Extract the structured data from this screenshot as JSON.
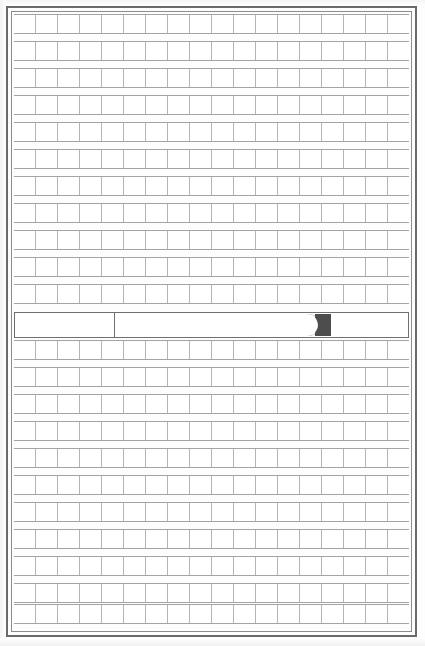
{
  "document": {
    "kind": "grid-ruled-form-sheet",
    "title": "Grid Ruled Sheet",
    "page_width": 425,
    "page_height": 646,
    "background_color": "#ffffff",
    "is_blank": true,
    "visible_text": ""
  },
  "border": {
    "style": "double-rule",
    "outer": {
      "color": "#6a6a6a",
      "thickness": 2,
      "left": 6,
      "top": 6,
      "width": 411,
      "height": 631
    },
    "inner": {
      "color": "#8c8c8c",
      "thickness": 1,
      "left": 11,
      "top": 11,
      "width": 401,
      "height": 621
    }
  },
  "grid": {
    "left": 14,
    "top": 14,
    "width": 395,
    "height": 615,
    "columns": 18,
    "row_line_color": "#a3a3a3",
    "cell_line_color": "#b4b4b4",
    "cell_fill": "#ffffff",
    "row_height": 19,
    "row_gap": 8,
    "rows_above_band": 11,
    "rows_below_band": 10,
    "rows_total": 21,
    "rows": [
      {
        "index": 1,
        "top": 0,
        "height": 20,
        "section": "upper"
      },
      {
        "index": 2,
        "top": 27,
        "height": 20,
        "section": "upper"
      },
      {
        "index": 3,
        "top": 54,
        "height": 20,
        "section": "upper"
      },
      {
        "index": 4,
        "top": 81,
        "height": 20,
        "section": "upper"
      },
      {
        "index": 5,
        "top": 108,
        "height": 20,
        "section": "upper"
      },
      {
        "index": 6,
        "top": 135,
        "height": 20,
        "section": "upper"
      },
      {
        "index": 7,
        "top": 162,
        "height": 20,
        "section": "upper"
      },
      {
        "index": 8,
        "top": 189,
        "height": 20,
        "section": "upper"
      },
      {
        "index": 9,
        "top": 216,
        "height": 20,
        "section": "upper"
      },
      {
        "index": 10,
        "top": 243,
        "height": 20,
        "section": "upper"
      },
      {
        "index": 11,
        "top": 270,
        "height": 20,
        "section": "upper"
      },
      {
        "index": 12,
        "top": 326,
        "height": 20,
        "section": "lower"
      },
      {
        "index": 13,
        "top": 353,
        "height": 20,
        "section": "lower"
      },
      {
        "index": 14,
        "top": 380,
        "height": 20,
        "section": "lower"
      },
      {
        "index": 15,
        "top": 407,
        "height": 20,
        "section": "lower"
      },
      {
        "index": 16,
        "top": 434,
        "height": 20,
        "section": "lower"
      },
      {
        "index": 17,
        "top": 461,
        "height": 20,
        "section": "lower"
      },
      {
        "index": 18,
        "top": 488,
        "height": 20,
        "section": "lower"
      },
      {
        "index": 19,
        "top": 515,
        "height": 20,
        "section": "lower"
      },
      {
        "index": 20,
        "top": 542,
        "height": 20,
        "section": "lower"
      },
      {
        "index": 21,
        "top": 569,
        "height": 20,
        "section": "lower"
      },
      {
        "index": 22,
        "top": 590,
        "height": 20,
        "section": "lower"
      }
    ]
  },
  "highlight_band": {
    "label": "emphasized rule band",
    "top": 298,
    "height": 26,
    "border_color": "#6f6f6f",
    "fill": "#ffffff",
    "divider": {
      "label": "vertical double divider",
      "left": 99,
      "color": "#6f6f6f"
    },
    "lozenge": {
      "label": "rounded-end bar",
      "left": 103,
      "right": 305,
      "fill": "#ffffff",
      "stroke": "#6f6f6f"
    },
    "marker": {
      "label": "dark crescent end cap",
      "left": 300,
      "width": 16,
      "fill": "#4d4d4d",
      "shape": "crescent"
    }
  },
  "colors": {
    "frame_dark": "#6a6a6a",
    "frame_light": "#8c8c8c",
    "rule": "#a3a3a3",
    "cell_rule": "#b4b4b4",
    "marker": "#4d4d4d",
    "paper": "#ffffff"
  }
}
